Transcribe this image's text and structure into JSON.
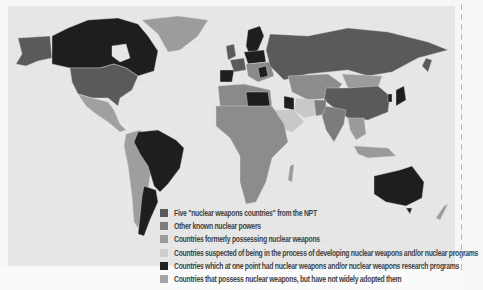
{
  "map": {
    "title": "Nuclear weapons status world map",
    "background_color": "#e6e6e6",
    "ocean_grid": true,
    "colors": {
      "npt_five": "#555555",
      "other_known": "#7a7a7a",
      "formerly": "#9a9a9a",
      "suspected": "#c8c8c8",
      "research": "#1c1c1c",
      "not_adopted": "#a8a8a8",
      "default_land": "#909090"
    }
  },
  "legend": {
    "items": [
      {
        "label": "Five \"nuclear weapons countries\" from the NPT",
        "color": "#5a5a5a"
      },
      {
        "label": "Other known nuclear powers",
        "color": "#7c7c7c"
      },
      {
        "label": "Countries formerly possessing nuclear weapons",
        "color": "#9c9c9c"
      },
      {
        "label": "Countries suspected of being in the process of developing nuclear weapons and/or nuclear programs",
        "color": "#cdcdcd"
      },
      {
        "label": "Countries which at one point had nuclear weapons and/or nuclear weapons research programs",
        "color": "#222222"
      },
      {
        "label": "Countries that possess nuclear weapons, but have not widely adopted them",
        "color": "#a5a5a5"
      }
    ]
  }
}
